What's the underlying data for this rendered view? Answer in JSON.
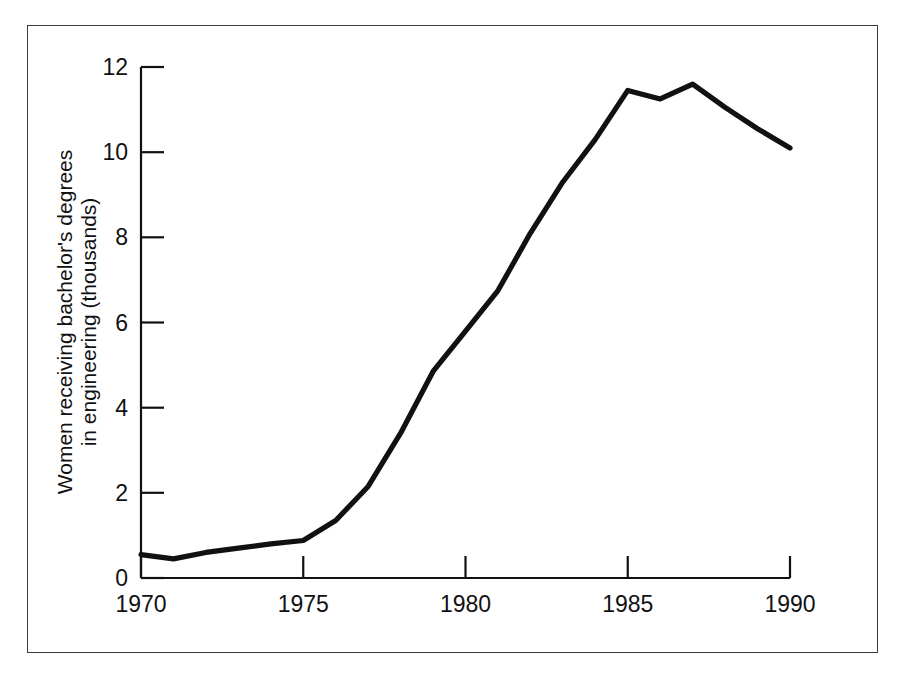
{
  "figure": {
    "frame_color": "#3a3a3a",
    "rule_color": "#111111"
  },
  "chart_data": {
    "type": "line",
    "title": "",
    "subtitle": "",
    "xlabel": "",
    "ylabel": "Women receiving bachelor's degrees in engineering (thousands)",
    "ylabel_line1": "Women receiving bachelor's degrees",
    "ylabel_line2": "in engineering (thousands)",
    "series_name": "Women receiving bachelor's degrees in engineering",
    "line_color": "#111111",
    "grid": false,
    "legend": "none",
    "xlim": [
      1970,
      1990
    ],
    "ylim": [
      0,
      12
    ],
    "xticks": [
      1970,
      1975,
      1980,
      1985,
      1990
    ],
    "xtick_labels": [
      "1970",
      "1975",
      "1980",
      "1985",
      "1990"
    ],
    "yticks": [
      0,
      2,
      4,
      6,
      8,
      10,
      12
    ],
    "ytick_labels": [
      "0",
      "2",
      "4",
      "6",
      "8",
      "10",
      "12"
    ],
    "x": [
      1970,
      1971,
      1972,
      1973,
      1974,
      1975,
      1976,
      1977,
      1978,
      1979,
      1980,
      1981,
      1982,
      1983,
      1984,
      1985,
      1986,
      1987,
      1988,
      1989,
      1990
    ],
    "values": [
      0.55,
      0.45,
      0.6,
      0.7,
      0.8,
      0.88,
      1.35,
      2.15,
      3.4,
      4.85,
      5.8,
      6.75,
      8.1,
      9.3,
      10.3,
      11.45,
      11.25,
      11.6,
      11.05,
      10.55,
      10.1
    ]
  }
}
